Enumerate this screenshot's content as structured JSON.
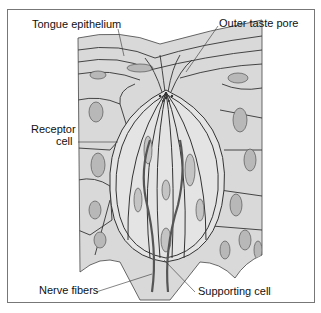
{
  "figure": {
    "labels": {
      "tongue_epithelium": "Tongue epithelium",
      "outer_taste_pore": "Outer taste pore",
      "receptor_cell_line1": "Receptor",
      "receptor_cell_line2": "cell",
      "nerve_fibers": "Nerve fibers",
      "supporting_cell": "Supporting cell"
    },
    "colors": {
      "tissue_fill": "#d9d9d9",
      "outline": "#333333",
      "nucleus": "#b8b8b8",
      "frame": "#777777"
    }
  }
}
